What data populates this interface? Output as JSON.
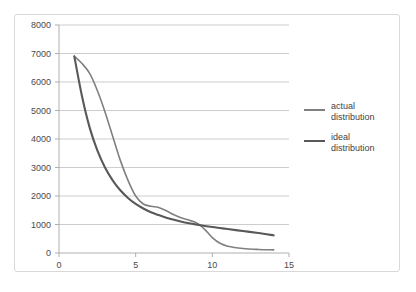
{
  "chart_data": {
    "type": "line",
    "title": "",
    "subtitle": "",
    "xlabel": "",
    "ylabel": "",
    "xlim": [
      0,
      15
    ],
    "ylim": [
      0,
      8000
    ],
    "grid": true,
    "legend_position": "right",
    "x_ticks": [
      "0",
      "5",
      "10",
      "15"
    ],
    "x_tick_values": [
      0,
      5,
      10,
      15
    ],
    "y_ticks": [
      "0",
      "1000",
      "2000",
      "3000",
      "4000",
      "5000",
      "6000",
      "7000",
      "8000"
    ],
    "y_tick_values": [
      0,
      1000,
      2000,
      3000,
      4000,
      5000,
      6000,
      7000,
      8000
    ],
    "series": [
      {
        "name": "actual distribution",
        "color": "#808080",
        "width": 1.6,
        "x": [
          1,
          1.5,
          2,
          2.5,
          3,
          3.5,
          4,
          4.5,
          5,
          5.5,
          6,
          6.5,
          7,
          7.5,
          8,
          8.5,
          9,
          9.5,
          10,
          10.5,
          11,
          12,
          13,
          14
        ],
        "values": [
          6900,
          6650,
          6300,
          5700,
          4950,
          4100,
          3250,
          2550,
          2000,
          1720,
          1640,
          1600,
          1480,
          1340,
          1230,
          1150,
          1050,
          830,
          540,
          340,
          240,
          160,
          125,
          110
        ]
      },
      {
        "name": "ideal distribution",
        "color": "#59595b",
        "width": 2.1,
        "x": [
          1,
          1.5,
          2,
          2.5,
          3,
          3.5,
          4,
          4.5,
          5,
          5.5,
          6,
          6.5,
          7,
          7.5,
          8,
          8.5,
          9,
          9.5,
          10,
          10.5,
          11,
          12,
          13,
          14
        ],
        "values": [
          6900,
          5500,
          4400,
          3600,
          3000,
          2550,
          2200,
          1930,
          1720,
          1560,
          1430,
          1330,
          1240,
          1165,
          1100,
          1045,
          995,
          950,
          910,
          875,
          840,
          770,
          700,
          620
        ]
      }
    ],
    "annotations": []
  },
  "legend": {
    "entries": [
      {
        "label": "actual distribution",
        "color": "#808080"
      },
      {
        "label": "ideal distribution",
        "color": "#59595b"
      }
    ]
  },
  "colors": {
    "background": "#ffffff",
    "frame_border": "#d9d9d9",
    "gridline": "#b8b8b8",
    "axis": "#a6a6a6",
    "tick_text": "#4a4a4a"
  }
}
